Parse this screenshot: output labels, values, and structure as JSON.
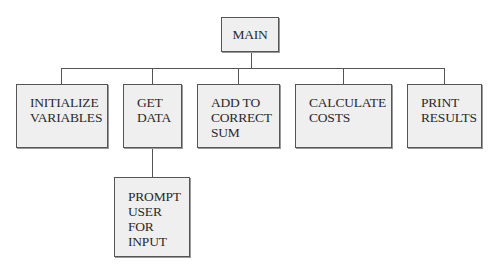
{
  "diagram": {
    "type": "hierarchy-chart",
    "root": {
      "id": "main",
      "label": "MAIN"
    },
    "children": [
      {
        "id": "initialize-variables",
        "label": "INITIALIZE\nVARIABLES"
      },
      {
        "id": "get-data",
        "label": "GET\nDATA"
      },
      {
        "id": "add-to-correct-sum",
        "label": "ADD TO\nCORRECT\nSUM"
      },
      {
        "id": "calculate-costs",
        "label": "CALCULATE\nCOSTS"
      },
      {
        "id": "print-results",
        "label": "PRINT\nRESULTS"
      }
    ],
    "grandchildren": [
      {
        "id": "prompt-user-for-input",
        "parent": "get-data",
        "label": "PROMPT\nUSER\nFOR\nINPUT"
      }
    ],
    "colors": {
      "box_fill": "#efefef",
      "box_border": "#555555",
      "line": "#555555",
      "text": "#2a2a2a",
      "background": "#ffffff"
    }
  }
}
